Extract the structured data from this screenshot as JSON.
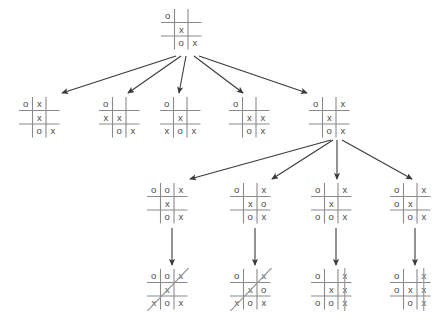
{
  "diagram": {
    "mark_x": "x",
    "mark_o": "o",
    "empty": "",
    "grid_color": "#8a8a8a",
    "mark_color": "#4a4a4a",
    "arrow_color": "#3a3a3a",
    "win_line_color": "#9a9a9a",
    "background": "#ffffff"
  },
  "levels": [
    {
      "name": "root",
      "nodes": [
        {
          "id": "root",
          "x": 160,
          "y": 8,
          "cells": [
            "o",
            "",
            "",
            "",
            "x",
            "",
            "",
            "o",
            "x"
          ],
          "win_line": null
        }
      ]
    },
    {
      "name": "level-2",
      "nodes": [
        {
          "id": "l2n1",
          "x": 18,
          "y": 96,
          "cells": [
            "o",
            "x",
            "",
            "",
            "x",
            "",
            "",
            "o",
            "x"
          ],
          "win_line": null
        },
        {
          "id": "l2n2",
          "x": 98,
          "y": 96,
          "cells": [
            "o",
            "",
            "",
            "x",
            "x",
            "",
            "",
            "o",
            "x"
          ],
          "win_line": null
        },
        {
          "id": "l2n3",
          "x": 159,
          "y": 96,
          "cells": [
            "o",
            "",
            "",
            "",
            "x",
            "",
            "x",
            "o",
            "x"
          ],
          "win_line": null
        },
        {
          "id": "l2n4",
          "x": 228,
          "y": 96,
          "cells": [
            "o",
            "",
            "",
            "",
            "x",
            "x",
            "",
            "o",
            "x"
          ],
          "win_line": null
        },
        {
          "id": "l2n5",
          "x": 308,
          "y": 96,
          "cells": [
            "o",
            "",
            "x",
            "",
            "x",
            "",
            "",
            "o",
            "x"
          ],
          "win_line": null
        }
      ]
    },
    {
      "name": "level-3",
      "nodes": [
        {
          "id": "l3n1",
          "x": 146,
          "y": 182,
          "cells": [
            "o",
            "o",
            "x",
            "",
            "x",
            "",
            "",
            "o",
            "x"
          ],
          "win_line": null
        },
        {
          "id": "l3n2",
          "x": 229,
          "y": 182,
          "cells": [
            "o",
            "",
            "x",
            "",
            "x",
            "o",
            "",
            "o",
            "x"
          ],
          "win_line": null
        },
        {
          "id": "l3n3",
          "x": 310,
          "y": 182,
          "cells": [
            "o",
            "",
            "x",
            "",
            "x",
            "",
            "o",
            "o",
            "x"
          ],
          "win_line": null
        },
        {
          "id": "l3n4",
          "x": 389,
          "y": 182,
          "cells": [
            "o",
            "",
            "x",
            "o",
            "x",
            "",
            "",
            "o",
            "x"
          ],
          "win_line": null
        }
      ]
    },
    {
      "name": "level-4",
      "nodes": [
        {
          "id": "l4n1",
          "x": 146,
          "y": 268,
          "cells": [
            "o",
            "o",
            "x",
            "",
            "x",
            "",
            "x",
            "o",
            "x"
          ],
          "win_line": "diagonal-anti"
        },
        {
          "id": "l4n2",
          "x": 229,
          "y": 268,
          "cells": [
            "o",
            "",
            "x",
            "",
            "x",
            "o",
            "x",
            "o",
            "x"
          ],
          "win_line": "diagonal-anti"
        },
        {
          "id": "l4n3",
          "x": 310,
          "y": 268,
          "cells": [
            "o",
            "",
            "x",
            "",
            "x",
            "x",
            "o",
            "o",
            "x"
          ],
          "win_line": "column-right"
        },
        {
          "id": "l4n4",
          "x": 389,
          "y": 268,
          "cells": [
            "o",
            "",
            "x",
            "o",
            "x",
            "x",
            "",
            "o",
            "x"
          ],
          "win_line": "column-right"
        }
      ]
    }
  ],
  "arrows": [
    {
      "id": "a1",
      "from": "root",
      "to": "l2n1",
      "x1": 176,
      "y1": 56,
      "x2": 62,
      "y2": 93
    },
    {
      "id": "a2",
      "from": "root",
      "to": "l2n2",
      "x1": 181,
      "y1": 56,
      "x2": 128,
      "y2": 93
    },
    {
      "id": "a3",
      "from": "root",
      "to": "l2n3",
      "x1": 186,
      "y1": 56,
      "x2": 179,
      "y2": 93
    },
    {
      "id": "a4",
      "from": "root",
      "to": "l2n4",
      "x1": 194,
      "y1": 56,
      "x2": 243,
      "y2": 93
    },
    {
      "id": "a5",
      "from": "root",
      "to": "l2n5",
      "x1": 199,
      "y1": 56,
      "x2": 307,
      "y2": 93
    },
    {
      "id": "a6",
      "from": "l2n5",
      "to": "l3n1",
      "x1": 331,
      "y1": 140,
      "x2": 190,
      "y2": 179
    },
    {
      "id": "a7",
      "from": "l2n5",
      "to": "l3n2",
      "x1": 333,
      "y1": 140,
      "x2": 272,
      "y2": 179
    },
    {
      "id": "a8",
      "from": "l2n5",
      "to": "l3n3",
      "x1": 337,
      "y1": 140,
      "x2": 337,
      "y2": 179
    },
    {
      "id": "a9",
      "from": "l2n5",
      "to": "l3n4",
      "x1": 342,
      "y1": 140,
      "x2": 412,
      "y2": 179
    },
    {
      "id": "a10",
      "from": "l3n1",
      "to": "l4n1",
      "x1": 172,
      "y1": 228,
      "x2": 172,
      "y2": 265
    },
    {
      "id": "a11",
      "from": "l3n2",
      "to": "l4n2",
      "x1": 255,
      "y1": 228,
      "x2": 255,
      "y2": 265
    },
    {
      "id": "a12",
      "from": "l3n3",
      "to": "l4n3",
      "x1": 336,
      "y1": 228,
      "x2": 336,
      "y2": 265
    },
    {
      "id": "a13",
      "from": "l3n4",
      "to": "l4n4",
      "x1": 415,
      "y1": 228,
      "x2": 415,
      "y2": 265
    }
  ]
}
